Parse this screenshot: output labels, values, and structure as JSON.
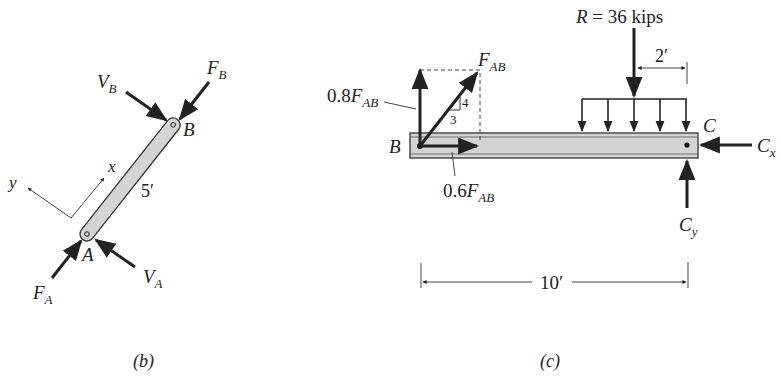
{
  "figure_b": {
    "caption": "(b)",
    "member": {
      "end_a": "A",
      "end_b": "B",
      "length": "5′"
    },
    "axes": {
      "x": "x",
      "y": "y"
    },
    "forces": {
      "F_B": {
        "main": "F",
        "sub": "B"
      },
      "V_B": {
        "main": "V",
        "sub": "B"
      },
      "F_A": {
        "main": "F",
        "sub": "A"
      },
      "V_A": {
        "main": "V",
        "sub": "A"
      }
    }
  },
  "figure_c": {
    "caption": "(c)",
    "points": {
      "B": "B",
      "C": "C"
    },
    "resultant": {
      "label": "R = 36 kips",
      "offset": "2′"
    },
    "span": "10′",
    "forces": {
      "F_AB": {
        "main": "F",
        "sub": "AB"
      },
      "vertical_component": {
        "coef": "0.8",
        "main": "F",
        "sub": "AB"
      },
      "horizontal_component": {
        "coef": "0.6",
        "main": "F",
        "sub": "AB"
      },
      "C_x": {
        "main": "C",
        "sub": "x"
      },
      "C_y": {
        "main": "C",
        "sub": "y"
      }
    },
    "slope_triangle": {
      "rise": "4",
      "run": "3"
    }
  },
  "colors": {
    "ink": "#222222",
    "member_fill": "#d4d4d4",
    "background": "#ffffff"
  }
}
